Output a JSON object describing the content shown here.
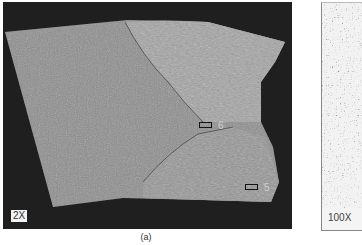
{
  "figure": {
    "caption": "(a)",
    "main_panel": {
      "magnification": "2X",
      "markers": [
        {
          "id": "marker-6",
          "label": "6"
        },
        {
          "id": "marker-5",
          "label": "5"
        }
      ]
    },
    "right_panel": {
      "magnification": "100X"
    }
  },
  "colors": {
    "background_dark": "#1f1f1f",
    "specimen_gray": "#8c8c8c",
    "weld_gray": "#9a9a9a",
    "page": "#ffffff"
  }
}
